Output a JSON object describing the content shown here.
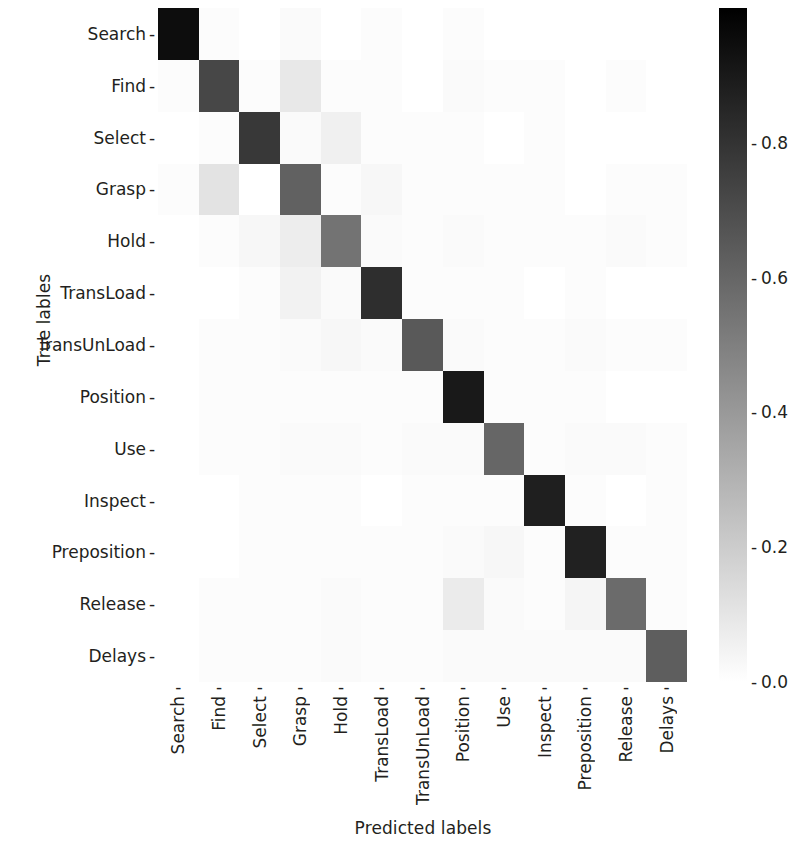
{
  "chart_data": {
    "type": "heatmap",
    "title": "",
    "xlabel": "Predicted labels",
    "ylabel": "True lables",
    "colormap": "gray_r",
    "grid": false,
    "legend_position": "right",
    "colorbar": {
      "ticks": [
        "0.8",
        "0.6",
        "0.4",
        "0.2",
        "0.0"
      ],
      "tick_values": [
        0.8,
        0.6,
        0.4,
        0.2,
        0.0
      ],
      "vmin": 0.0,
      "vmax": 1.0,
      "low_color": "#ffffff",
      "high_color": "#000000"
    },
    "categories": [
      "Search",
      "Find",
      "Select",
      "Grasp",
      "Hold",
      "TransLoad",
      "TransUnLoad",
      "Position",
      "Use",
      "Inspect",
      "Preposition",
      "Release",
      "Delays"
    ],
    "x_tick_labels": [
      "Search",
      "Find",
      "Select",
      "Grasp",
      "Hold",
      "TransLoad",
      "TransUnLoad",
      "Position",
      "Use",
      "Inspect",
      "Preposition",
      "Release",
      "Delays"
    ],
    "y_tick_labels": [
      "Search",
      "Find",
      "Select",
      "Grasp",
      "Hold",
      "TransLoad",
      "TransUnLoad",
      "Position",
      "Use",
      "Inspect",
      "Preposition",
      "Release",
      "Delays"
    ],
    "values": [
      [
        0.95,
        0.01,
        0.0,
        0.02,
        0.0,
        0.01,
        0.0,
        0.01,
        0.0,
        0.0,
        0.0,
        0.0,
        0.0
      ],
      [
        0.01,
        0.72,
        0.01,
        0.09,
        0.01,
        0.01,
        0.0,
        0.02,
        0.01,
        0.01,
        0.0,
        0.01,
        0.0
      ],
      [
        0.0,
        0.01,
        0.78,
        0.02,
        0.06,
        0.01,
        0.01,
        0.01,
        0.0,
        0.01,
        0.0,
        0.0,
        0.0
      ],
      [
        0.01,
        0.11,
        0.0,
        0.62,
        0.01,
        0.03,
        0.01,
        0.01,
        0.01,
        0.01,
        0.0,
        0.01,
        0.01
      ],
      [
        0.0,
        0.01,
        0.03,
        0.07,
        0.55,
        0.02,
        0.01,
        0.02,
        0.01,
        0.01,
        0.01,
        0.02,
        0.01
      ],
      [
        0.0,
        0.0,
        0.01,
        0.05,
        0.02,
        0.82,
        0.01,
        0.01,
        0.01,
        0.0,
        0.01,
        0.0,
        0.0
      ],
      [
        0.0,
        0.01,
        0.01,
        0.02,
        0.03,
        0.02,
        0.65,
        0.02,
        0.01,
        0.01,
        0.02,
        0.01,
        0.01
      ],
      [
        0.0,
        0.01,
        0.01,
        0.01,
        0.01,
        0.01,
        0.01,
        0.9,
        0.01,
        0.01,
        0.01,
        0.0,
        0.0
      ],
      [
        0.0,
        0.01,
        0.01,
        0.02,
        0.02,
        0.01,
        0.02,
        0.02,
        0.6,
        0.01,
        0.02,
        0.02,
        0.01
      ],
      [
        0.0,
        0.0,
        0.01,
        0.01,
        0.01,
        0.0,
        0.01,
        0.01,
        0.01,
        0.88,
        0.01,
        0.0,
        0.01
      ],
      [
        0.0,
        0.0,
        0.01,
        0.01,
        0.01,
        0.01,
        0.01,
        0.02,
        0.03,
        0.01,
        0.87,
        0.01,
        0.01
      ],
      [
        0.0,
        0.01,
        0.01,
        0.01,
        0.02,
        0.01,
        0.01,
        0.08,
        0.02,
        0.01,
        0.04,
        0.58,
        0.01
      ],
      [
        0.0,
        0.01,
        0.01,
        0.01,
        0.02,
        0.01,
        0.01,
        0.02,
        0.02,
        0.02,
        0.02,
        0.02,
        0.63
      ]
    ],
    "axis_ranges": {
      "x": [
        0,
        13
      ],
      "y": [
        0,
        13
      ]
    }
  },
  "axes": {
    "x_title": "Predicted labels",
    "y_title": "True lables"
  },
  "tick_marker": "-"
}
